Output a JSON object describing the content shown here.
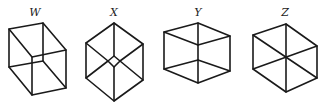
{
  "figures": [
    {
      "label": "W",
      "description": "cube drawn in oblique view, front face lower-right"
    },
    {
      "label": "X",
      "description": "hexagon outline with three diagonals meeting at small central square"
    },
    {
      "label": "Y",
      "description": "cube in isometric view with visible top face"
    },
    {
      "label": "Z",
      "description": "hexagon with three diagonals meeting at central point"
    }
  ],
  "colors": {
    "stroke": "#1a1a1a",
    "background": "#ffffff"
  }
}
